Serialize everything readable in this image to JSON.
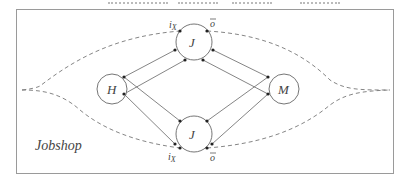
{
  "diagram": {
    "caption": "Jobshop",
    "nodes": [
      {
        "id": "H",
        "label": "H",
        "cx": 112,
        "cy": 89,
        "r": 15
      },
      {
        "id": "J_top",
        "label": "J",
        "cx": 194,
        "cy": 42,
        "r": 18
      },
      {
        "id": "J_bottom",
        "label": "J",
        "cx": 194,
        "cy": 134,
        "r": 18
      },
      {
        "id": "M",
        "label": "M",
        "cx": 284,
        "cy": 89,
        "r": 15
      }
    ],
    "port_labels": {
      "top_input": "i",
      "top_input_sub": "X",
      "top_output": "o",
      "bottom_input": "i",
      "bottom_input_sub": "X",
      "bottom_output": "o"
    },
    "colors": {
      "stroke": "#555555",
      "dash": "#777777",
      "border": "#999999",
      "text": "#444444"
    }
  }
}
